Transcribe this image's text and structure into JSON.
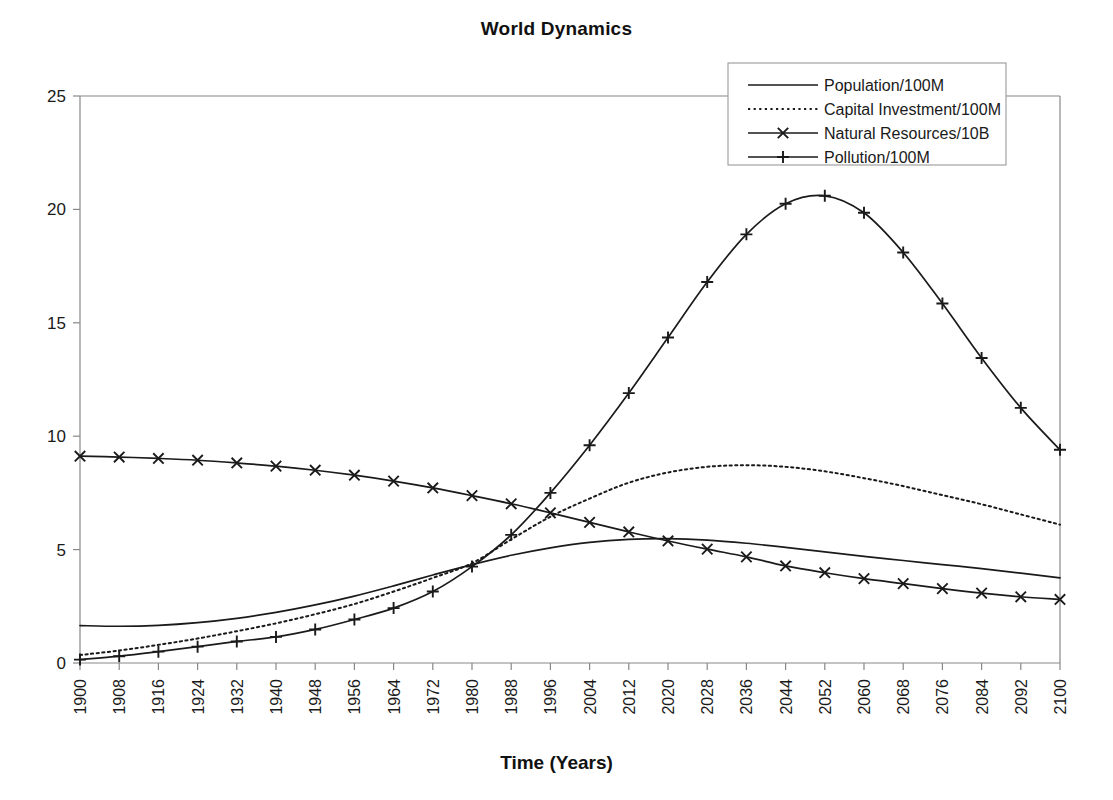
{
  "chart_data": {
    "type": "line",
    "title": "World Dynamics",
    "xlabel": "Time (Years)",
    "ylabel": "",
    "xlim": [
      1900,
      2100
    ],
    "ylim": [
      0,
      25
    ],
    "ytick_step": 5,
    "xtick_step": 8,
    "grid": false,
    "legend_position": "top-right",
    "yticks": [
      "0",
      "5",
      "10",
      "15",
      "20",
      "25"
    ],
    "categories": [
      "1900",
      "1908",
      "1916",
      "1924",
      "1932",
      "1940",
      "1948",
      "1956",
      "1964",
      "1972",
      "1980",
      "1988",
      "1996",
      "2004",
      "2012",
      "2020",
      "2028",
      "2036",
      "2044",
      "2052",
      "2060",
      "2068",
      "2076",
      "2084",
      "2092",
      "2100"
    ],
    "series": [
      {
        "name": "Population/100M",
        "style": "solid",
        "marker": "none",
        "color": "#1a1a1a",
        "values": [
          1.65,
          1.62,
          1.66,
          1.78,
          1.97,
          2.23,
          2.56,
          2.95,
          3.4,
          3.88,
          4.34,
          4.75,
          5.08,
          5.32,
          5.45,
          5.48,
          5.42,
          5.28,
          5.1,
          4.9,
          4.7,
          4.52,
          4.34,
          4.16,
          3.96,
          3.75
        ]
      },
      {
        "name": "Capital Investment/100M",
        "style": "dotted",
        "marker": "none",
        "color": "#1a1a1a",
        "values": [
          0.35,
          0.55,
          0.8,
          1.08,
          1.4,
          1.75,
          2.15,
          2.6,
          3.15,
          3.75,
          4.4,
          5.45,
          6.45,
          7.25,
          7.95,
          8.4,
          8.65,
          8.72,
          8.65,
          8.45,
          8.15,
          7.8,
          7.4,
          7.0,
          6.55,
          6.1
        ]
      },
      {
        "name": "Natural Resources/10B",
        "style": "solid",
        "marker": "x",
        "color": "#1a1a1a",
        "values": [
          9.12,
          9.08,
          9.02,
          8.94,
          8.82,
          8.68,
          8.5,
          8.28,
          8.02,
          7.72,
          7.38,
          7.02,
          6.62,
          6.2,
          5.78,
          5.38,
          5.02,
          4.68,
          4.28,
          3.98,
          3.72,
          3.5,
          3.28,
          3.08,
          2.92,
          2.8
        ]
      },
      {
        "name": "Pollution/100M",
        "style": "solid",
        "marker": "plus",
        "color": "#1a1a1a",
        "values": [
          0.15,
          0.3,
          0.5,
          0.72,
          0.95,
          1.15,
          1.48,
          1.92,
          2.42,
          3.15,
          4.25,
          5.65,
          7.5,
          9.6,
          11.9,
          14.35,
          16.8,
          18.9,
          20.25,
          20.6,
          19.85,
          18.1,
          15.85,
          13.45,
          11.25,
          9.4
        ]
      }
    ]
  },
  "legend": {
    "items": [
      {
        "label": "Population/100M"
      },
      {
        "label": "Capital Investment/100M"
      },
      {
        "label": "Natural Resources/10B"
      },
      {
        "label": "Pollution/100M"
      }
    ]
  }
}
